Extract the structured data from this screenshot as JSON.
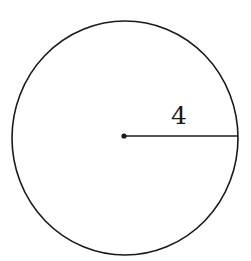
{
  "diagram": {
    "type": "circle-with-radius",
    "radius_label": "4",
    "colors": {
      "stroke": "#1a1a1a",
      "background": "#ffffff"
    }
  }
}
